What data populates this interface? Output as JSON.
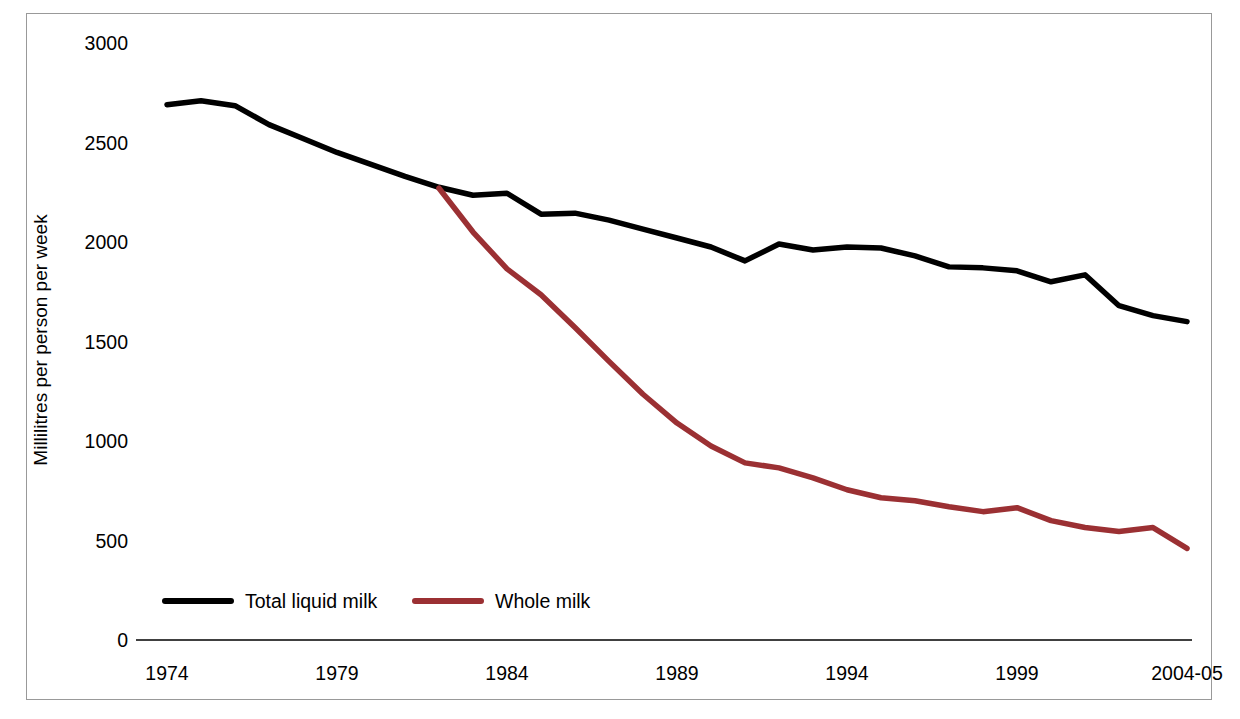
{
  "chart_data": {
    "type": "line",
    "title": "",
    "xlabel": "",
    "ylabel": "Millilitres per person per week",
    "ylim": [
      0,
      3000
    ],
    "yticks": [
      0,
      500,
      1000,
      1500,
      2000,
      2500,
      3000
    ],
    "ytick_labels": [
      "0",
      "500",
      "1000",
      "1500",
      "2000",
      "2500",
      "3000"
    ],
    "xticks": [
      1974,
      1979,
      1984,
      1989,
      1994,
      1999,
      2004
    ],
    "xtick_labels": [
      "1974",
      "1979",
      "1984",
      "1989",
      "1994",
      "1999",
      "2004-05"
    ],
    "xlim": [
      1974,
      2004
    ],
    "grid": false,
    "legend_position": "bottom-left",
    "series": [
      {
        "name": "Total liquid milk",
        "color": "#000000",
        "x": [
          1974,
          1975,
          1976,
          1977,
          1978,
          1979,
          1980,
          1981,
          1982,
          1983,
          1984,
          1985,
          1986,
          1987,
          1988,
          1989,
          1990,
          1991,
          1992,
          1993,
          1994,
          1995,
          1996,
          1997,
          1998,
          1999,
          2000,
          2001,
          2002,
          2003,
          2004
        ],
        "values": [
          2690,
          2710,
          2685,
          2590,
          2520,
          2450,
          2390,
          2330,
          2275,
          2235,
          2245,
          2140,
          2145,
          2110,
          2065,
          2020,
          1975,
          1905,
          1990,
          1960,
          1975,
          1970,
          1930,
          1875,
          1870,
          1855,
          1800,
          1835,
          1680,
          1630,
          1600
        ],
        "last_value": 1600
      },
      {
        "name": "Whole milk",
        "color": "#9B3033",
        "x": [
          1982,
          1983,
          1984,
          1985,
          1986,
          1987,
          1988,
          1989,
          1990,
          1991,
          1992,
          1993,
          1994,
          1995,
          1996,
          1997,
          1998,
          1999,
          2000,
          2001,
          2002,
          2003,
          2004
        ],
        "values": [
          2270,
          2050,
          1865,
          1735,
          1570,
          1400,
          1235,
          1090,
          975,
          890,
          865,
          815,
          755,
          715,
          700,
          670,
          645,
          665,
          600,
          565,
          545,
          565,
          460
        ],
        "last_value": 460
      }
    ]
  },
  "legend": {
    "items": [
      {
        "label": "Total liquid milk",
        "color": "#000000"
      },
      {
        "label": "Whole milk",
        "color": "#9B3033"
      }
    ]
  },
  "axes": {
    "y_title": "Millilitres per person per week"
  }
}
